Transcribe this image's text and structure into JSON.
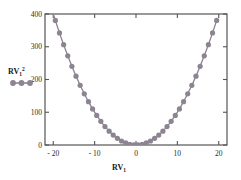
{
  "chart_data": {
    "type": "scatter",
    "title": "",
    "xlabel": "RV1",
    "ylabel": "",
    "legend_label": "RV1^2",
    "legend_position": "left-middle",
    "grid": false,
    "xlim": [
      -22,
      22
    ],
    "ylim": [
      0,
      400
    ],
    "xticks": [
      -20,
      -10,
      0,
      10,
      20
    ],
    "xticklabels": [
      "- 20",
      "- 10",
      "0",
      "10",
      "20"
    ],
    "yticks": [
      0,
      100,
      200,
      300,
      400
    ],
    "yticklabels": [
      "0",
      "100",
      "200",
      "300",
      "400"
    ],
    "marker_color": "#8c8491",
    "line_color": "#8c8491",
    "axis_color": "#555555",
    "series": [
      {
        "name": "RV1^2",
        "x": [
          -20.5,
          -19.5,
          -18.5,
          -17.5,
          -16.5,
          -15.5,
          -14.5,
          -13.5,
          -12.5,
          -11.5,
          -10.5,
          -9.5,
          -8.5,
          -7.5,
          -6.5,
          -5.5,
          -4.5,
          -3.5,
          -2.5,
          -1.5,
          -0.5,
          0.5,
          1.5,
          2.5,
          3.5,
          4.5,
          5.5,
          6.5,
          7.5,
          8.5,
          9.5,
          10.5,
          11.5,
          12.5,
          13.5,
          14.5,
          15.5,
          16.5,
          17.5,
          18.5,
          19.5
        ],
        "y": [
          420.25,
          380.25,
          342.25,
          306.25,
          272.25,
          240.25,
          210.25,
          182.25,
          156.25,
          132.25,
          110.25,
          90.25,
          72.25,
          56.25,
          42.25,
          30.25,
          20.25,
          12.25,
          6.25,
          2.25,
          0.25,
          0.25,
          2.25,
          6.25,
          12.25,
          20.25,
          30.25,
          42.25,
          56.25,
          72.25,
          90.25,
          110.25,
          132.25,
          156.25,
          182.25,
          210.25,
          240.25,
          272.25,
          306.25,
          342.25,
          380.25
        ]
      }
    ]
  },
  "legend": {
    "text_main": "RV",
    "text_sub": "1",
    "text_sup": "2"
  },
  "axis": {
    "x_title_main": "RV",
    "x_title_sub": "1"
  }
}
